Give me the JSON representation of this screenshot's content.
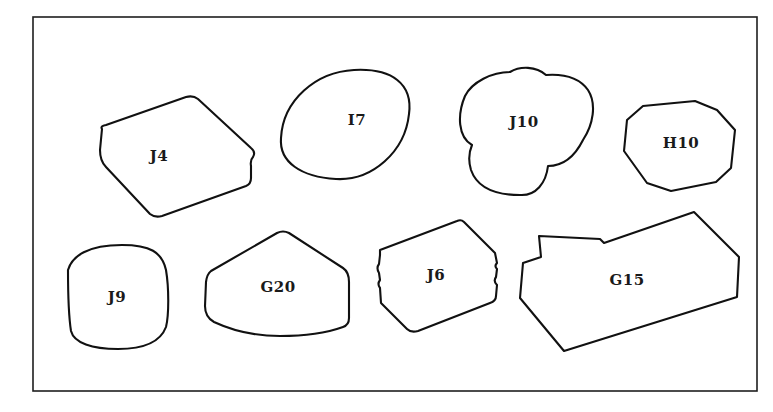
{
  "figure": {
    "type": "outline-shapes-specimen-plate",
    "frame": {
      "x": 33,
      "y": 17,
      "width": 724,
      "height": 374
    },
    "shapes": [
      {
        "id": "J4",
        "label": "J4",
        "label_pos": [
          159,
          157
        ],
        "description": "irregular hexagonal outline, notched right edge"
      },
      {
        "id": "I7",
        "label": "I7",
        "label_pos": [
          357,
          121
        ],
        "description": "tilted oval"
      },
      {
        "id": "J10",
        "label": "J10",
        "label_pos": [
          524,
          123
        ],
        "description": "tri-lobed clover outline"
      },
      {
        "id": "H10",
        "label": "H10",
        "label_pos": [
          681,
          144
        ],
        "description": "irregular octagon"
      },
      {
        "id": "J9",
        "label": "J9",
        "label_pos": [
          117,
          298
        ],
        "description": "rounded square"
      },
      {
        "id": "G20",
        "label": "G20",
        "label_pos": [
          278,
          288
        ],
        "description": "pentagon / house shape with rounded base"
      },
      {
        "id": "J6",
        "label": "J6",
        "label_pos": [
          436,
          276
        ],
        "description": "tilted hexagon with crenellated side edges"
      },
      {
        "id": "G15",
        "label": "G15",
        "label_pos": [
          627,
          281
        ],
        "description": "elongated irregular polygon with stepped notch at upper left"
      }
    ]
  }
}
